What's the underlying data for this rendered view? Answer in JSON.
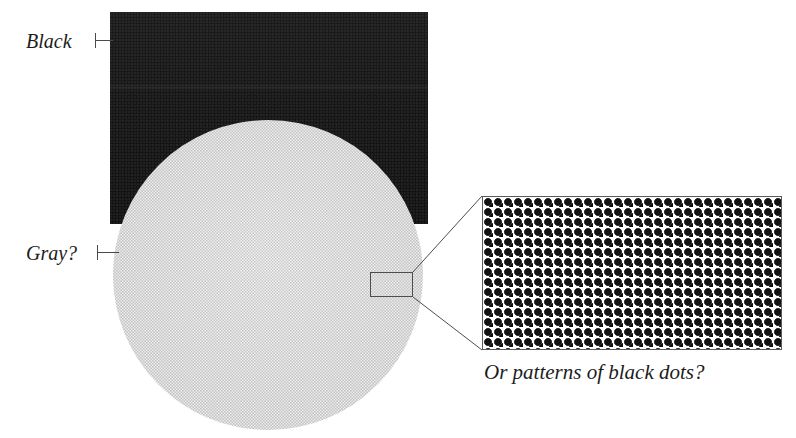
{
  "figure": {
    "labels": {
      "black": "Black",
      "gray": "Gray?"
    },
    "caption": "Or patterns of black dots?",
    "colors": {
      "black_block": "#141414",
      "gray_disc": "#dcdcdc",
      "dot_color": "#111111",
      "panel_background": "#ffffff",
      "line_color": "#4d4d4d",
      "text_color": "#1c1c1c",
      "page_background": "#ffffff"
    },
    "geometry": {
      "black_block": {
        "x": 110,
        "y": 12,
        "width": 318,
        "height": 212
      },
      "gray_disc": {
        "center_x": 268,
        "center_y": 275,
        "radius": 155
      },
      "magnifier_rect": {
        "x": 370,
        "y": 272,
        "width": 43,
        "height": 25
      },
      "zoom_panel": {
        "x": 482,
        "y": 196,
        "width": 300,
        "height": 154
      },
      "dot_pitch_px": 10,
      "dot_radius_px": 3.2,
      "dot_lattice": "offset-diagonal"
    }
  }
}
